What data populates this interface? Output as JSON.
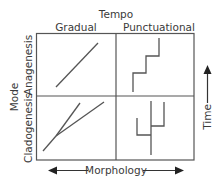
{
  "title": "Tempo",
  "columns": [
    {
      "label": "Gradual"
    },
    {
      "label": "Punctuational"
    }
  ],
  "row_axis_label": "Mode",
  "rows": [
    {
      "label": "Anagenesis"
    },
    {
      "label": "Cladogenesis"
    }
  ],
  "x_axis": {
    "label": "Morphology",
    "direction": "bidirectional"
  },
  "y_axis": {
    "label": "Time",
    "direction": "up"
  },
  "colors": {
    "line": "#555555",
    "text": "#3a3a3a",
    "background": "#ffffff"
  },
  "cells": [
    {
      "row": "Anagenesis",
      "column": "Gradual",
      "depiction": "single diagonal line (gradual change)"
    },
    {
      "row": "Anagenesis",
      "column": "Punctuational",
      "depiction": "staircase line (stasis with rapid jumps)"
    },
    {
      "row": "Cladogenesis",
      "column": "Gradual",
      "depiction": "diverging diagonal branches"
    },
    {
      "row": "Cladogenesis",
      "column": "Punctuational",
      "depiction": "vertical branches with right-angle splits"
    }
  ]
}
